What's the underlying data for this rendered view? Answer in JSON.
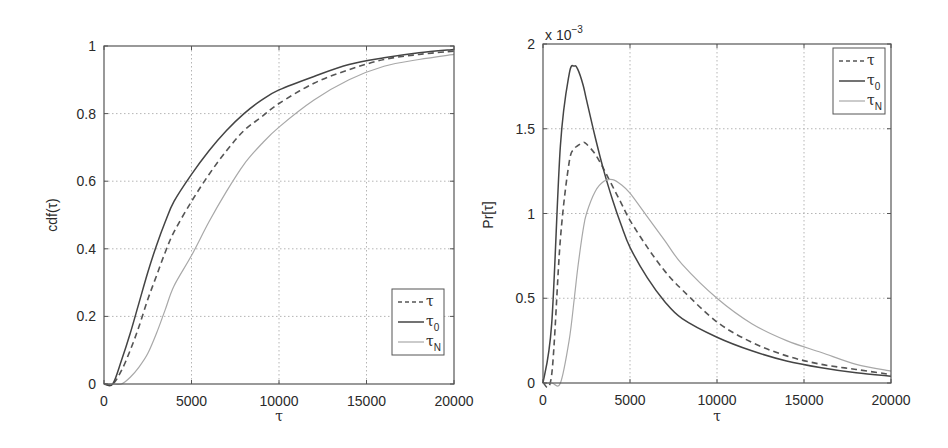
{
  "figure": {
    "left_panel": {
      "ylabel": "cdf(τ)",
      "xlabel": "τ",
      "xticks": [
        "0",
        "5000",
        "10000",
        "15000",
        "20000"
      ],
      "yticks": [
        "0",
        "0.2",
        "0.4",
        "0.6",
        "0.8",
        "1"
      ],
      "legend": [
        {
          "label": "τ",
          "sub": "",
          "style": "dashed"
        },
        {
          "label": "τ",
          "sub": "0",
          "style": "solid-dark"
        },
        {
          "label": "τ",
          "sub": "N",
          "style": "solid-light"
        }
      ]
    },
    "right_panel": {
      "ylabel": "Pr[τ]",
      "xlabel": "τ",
      "exponent_label": "x 10",
      "exponent_power": "−3",
      "xticks": [
        "0",
        "5000",
        "10000",
        "15000",
        "20000"
      ],
      "yticks": [
        "0",
        "0.5",
        "1",
        "1.5",
        "2"
      ],
      "legend": [
        {
          "label": "τ",
          "sub": "",
          "style": "dashed"
        },
        {
          "label": "τ",
          "sub": "0",
          "style": "solid-dark"
        },
        {
          "label": "τ",
          "sub": "N",
          "style": "solid-light"
        }
      ]
    }
  },
  "colors": {
    "tau": "#555555",
    "tau0": "#444444",
    "tauN": "#a8a8a8",
    "grid": "#b5b5b5",
    "axis": "#555555"
  },
  "chart_data": [
    {
      "type": "line",
      "title": "",
      "xlabel": "τ",
      "ylabel": "cdf(τ)",
      "xlim": [
        0,
        20000
      ],
      "ylim": [
        0,
        1
      ],
      "grid": true,
      "legend_position": "lower right",
      "x": [
        0,
        500,
        1000,
        1500,
        2000,
        2500,
        3000,
        3500,
        4000,
        5000,
        6000,
        7000,
        8000,
        9000,
        10000,
        12000,
        14000,
        16000,
        18000,
        20000
      ],
      "series": [
        {
          "name": "τ",
          "style": "dashed",
          "values": [
            0,
            0.0,
            0.04,
            0.1,
            0.17,
            0.25,
            0.32,
            0.39,
            0.45,
            0.54,
            0.62,
            0.69,
            0.75,
            0.79,
            0.83,
            0.89,
            0.93,
            0.96,
            0.975,
            0.985
          ]
        },
        {
          "name": "τ0",
          "style": "solid",
          "values": [
            0,
            0.0,
            0.07,
            0.15,
            0.24,
            0.33,
            0.41,
            0.48,
            0.54,
            0.62,
            0.69,
            0.75,
            0.8,
            0.84,
            0.87,
            0.91,
            0.945,
            0.965,
            0.98,
            0.99
          ]
        },
        {
          "name": "τN",
          "style": "solid-light",
          "values": [
            0,
            0,
            0.0,
            0.02,
            0.05,
            0.09,
            0.15,
            0.22,
            0.29,
            0.38,
            0.48,
            0.57,
            0.65,
            0.71,
            0.76,
            0.84,
            0.9,
            0.94,
            0.96,
            0.975
          ]
        }
      ]
    },
    {
      "type": "line",
      "title": "",
      "xlabel": "τ",
      "ylabel": "Pr[τ]",
      "y_scale_factor": "x 10^-3",
      "xlim": [
        0,
        20000
      ],
      "ylim": [
        0,
        2
      ],
      "grid": true,
      "legend_position": "upper right",
      "x": [
        0,
        500,
        1000,
        1500,
        1800,
        2000,
        2300,
        2500,
        3000,
        3500,
        4000,
        4500,
        5000,
        6000,
        7000,
        8000,
        10000,
        12000,
        14000,
        16000,
        18000,
        20000
      ],
      "series": [
        {
          "name": "τ",
          "style": "dashed",
          "values": [
            0,
            0.05,
            0.85,
            1.3,
            1.38,
            1.4,
            1.42,
            1.41,
            1.35,
            1.26,
            1.16,
            1.06,
            0.96,
            0.8,
            0.66,
            0.55,
            0.36,
            0.24,
            0.16,
            0.11,
            0.08,
            0.05
          ]
        },
        {
          "name": "τ0",
          "style": "solid",
          "values": [
            0,
            0.35,
            1.4,
            1.82,
            1.87,
            1.85,
            1.76,
            1.67,
            1.45,
            1.25,
            1.08,
            0.93,
            0.8,
            0.62,
            0.48,
            0.38,
            0.27,
            0.19,
            0.13,
            0.09,
            0.06,
            0.04
          ]
        },
        {
          "name": "τN",
          "style": "solid-light",
          "values": [
            0,
            0,
            0.0,
            0.25,
            0.5,
            0.68,
            0.9,
            1.0,
            1.13,
            1.19,
            1.2,
            1.17,
            1.12,
            0.98,
            0.84,
            0.7,
            0.5,
            0.35,
            0.25,
            0.18,
            0.11,
            0.07
          ]
        }
      ]
    }
  ]
}
